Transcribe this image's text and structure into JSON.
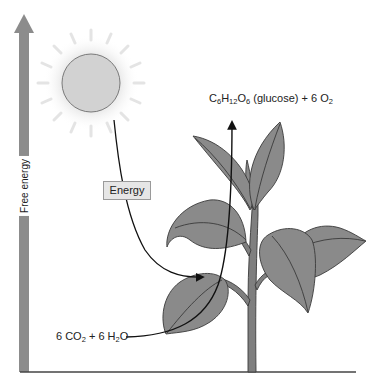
{
  "figure": {
    "type": "photosynthesis-energy-diagram",
    "axis": {
      "label": "Free energy",
      "direction": "up"
    },
    "sun": {
      "label": ""
    },
    "energy_box": {
      "label": "Energy"
    },
    "products": {
      "prefix": "C",
      "c_sub": "6",
      "h": "H",
      "h_sub": "12",
      "o": "O",
      "o_sub": "6",
      "name": " (glucose) + 6 O",
      "o2_sub": "2"
    },
    "reactants": {
      "part1": "6 CO",
      "co2_sub": "2",
      "part2": " + 6 H",
      "h2o_sub": "2",
      "part3": "O"
    },
    "colors": {
      "axis_bar": "#8c8c8c",
      "sun_fill": "#d2d2d2",
      "sun_glow": "#ececec",
      "leaf_fill": "#8a8a8a",
      "leaf_stroke": "#3a3a3a",
      "stem": "#7f7f7f",
      "arrow": "#111111",
      "baseline": "#444444"
    }
  }
}
